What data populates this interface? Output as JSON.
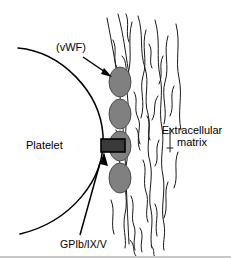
{
  "figure": {
    "width": 231,
    "height": 258,
    "background": "#ffffff"
  },
  "labels": {
    "vwf": "(vWF)",
    "platelet": "Platelet",
    "ecm_line1": "Extracellular",
    "ecm_line2": "matrix",
    "gpib": "GPIb/IX/V"
  },
  "colors": {
    "outline": "#000000",
    "vwf_fill": "#808080",
    "vwf_stroke": "#4d4d4d",
    "receptor_fill": "#3a3a3a",
    "receptor_stroke": "#000000",
    "matrix_fiber": "#1a1a1a",
    "bottom_border": "#c8c8c8",
    "background": "#ffffff"
  },
  "elements": {
    "platelet_membrane": "large circular arc on the left representing the platelet surface",
    "vwf_multimers": [
      {
        "cx": 120,
        "cy": 82,
        "rx": 11,
        "ry": 15
      },
      {
        "cx": 120,
        "cy": 114,
        "rx": 11,
        "ry": 15
      },
      {
        "cx": 120,
        "cy": 146,
        "rx": 11,
        "ry": 15
      },
      {
        "cx": 120,
        "cy": 178,
        "rx": 11,
        "ry": 15
      }
    ],
    "receptor_bar": {
      "x": 101,
      "y": 139,
      "width": 24,
      "height": 13
    },
    "arrow_vwf": {
      "from": [
        83,
        57
      ],
      "to": [
        111,
        76
      ]
    },
    "arrow_gpib": {
      "from": [
        92,
        182
      ],
      "to": [
        108,
        155
      ]
    },
    "matrix_region": "vertical band of wavy collagen fibers on the right"
  }
}
